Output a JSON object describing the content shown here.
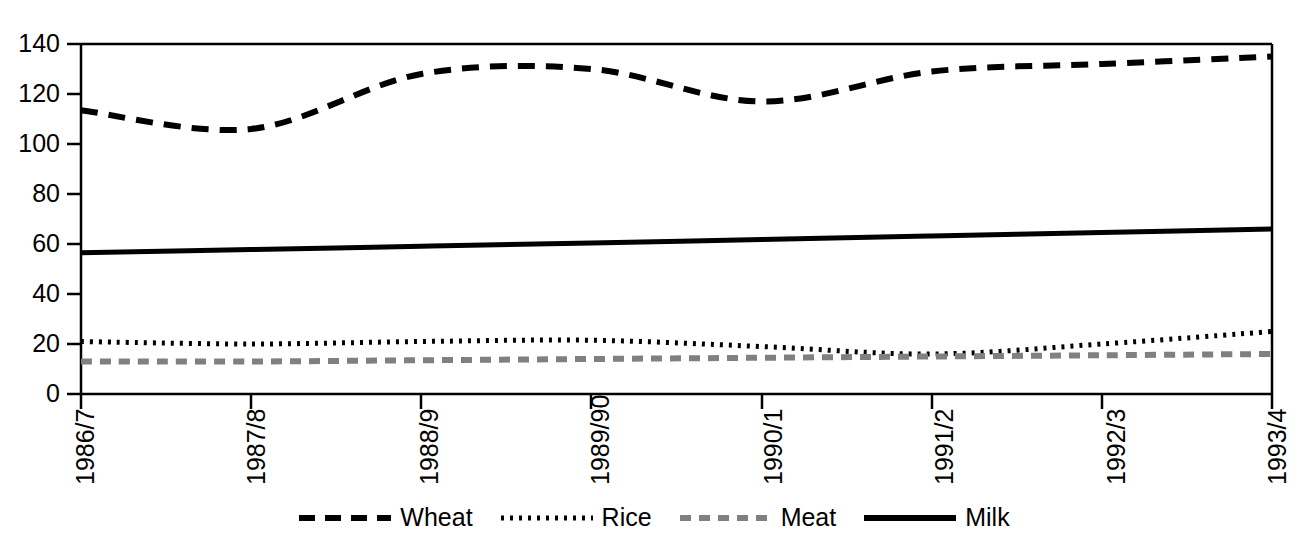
{
  "chart_data": {
    "type": "line",
    "title": "",
    "subtitle": "",
    "xlabel": "",
    "ylabel": "",
    "categories": [
      "1986/7",
      "1987/8",
      "1988/9",
      "1989/90",
      "1990/1",
      "1991/2",
      "1992/3",
      "1993/4"
    ],
    "ylim": [
      0,
      140
    ],
    "ytick_labels": [
      "0",
      "20",
      "40",
      "60",
      "80",
      "100",
      "120",
      "140"
    ],
    "yticks": [
      0,
      20,
      40,
      60,
      80,
      100,
      120,
      140
    ],
    "grid": false,
    "legend_position": "bottom",
    "smoothing": "spline",
    "series": [
      {
        "name": "Wheat",
        "style": "dashed",
        "color": "#000000",
        "values": [
          113.5,
          106,
          128,
          130,
          117,
          129,
          132,
          135
        ]
      },
      {
        "name": "Rice",
        "style": "dotted",
        "color": "#000000",
        "values": [
          21,
          20,
          21,
          21.5,
          19,
          16,
          20,
          25
        ]
      },
      {
        "name": "Meat",
        "style": "dashed",
        "color": "#808080",
        "values": [
          13,
          13,
          13.5,
          14,
          14.5,
          15,
          15.5,
          16
        ]
      },
      {
        "name": "Milk",
        "style": "solid",
        "color": "#000000",
        "values": [
          56.5,
          57.8,
          59.1,
          60.4,
          61.8,
          63.2,
          64.6,
          66
        ]
      }
    ]
  },
  "legend": {
    "items": [
      {
        "label": "Wheat",
        "swatch": "dashed-line-icon"
      },
      {
        "label": "Rice",
        "swatch": "dotted-line-icon"
      },
      {
        "label": "Meat",
        "swatch": "gray-dashed-line-icon"
      },
      {
        "label": "Milk",
        "swatch": "solid-line-icon"
      }
    ]
  },
  "axes": {
    "y_tick_labels": [
      "140",
      "120",
      "100",
      "80",
      "60",
      "40",
      "20",
      "0"
    ],
    "x_tick_labels": [
      "1986/7",
      "1987/8",
      "1988/9",
      "1989/90",
      "1990/1",
      "1991/2",
      "1992/3",
      "1993/4"
    ]
  },
  "colors": {
    "wheat": "#000000",
    "rice": "#000000",
    "meat": "#808080",
    "milk": "#000000",
    "axis": "#000000",
    "background": "#ffffff"
  }
}
